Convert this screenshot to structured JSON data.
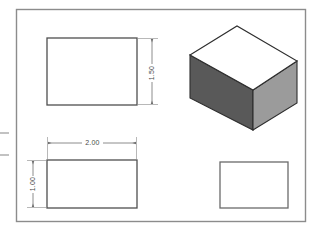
{
  "drawing": {
    "title": "Orthographic Multiview Drawing with Isometric Pictorial",
    "sheet": {
      "border_color": "#8c8c8c",
      "background_color": "#ffffff",
      "frame": {
        "x": 16,
        "y": 9,
        "width": 290,
        "height": 213
      }
    },
    "line_color": "#555555",
    "edge_color": "#3a3a3a",
    "dimension_color": "#6e6e6e",
    "views": [
      {
        "name": "front-view",
        "label": "Front View",
        "shape": "rectangle",
        "x": 47,
        "y": 38,
        "width": 90,
        "height": 67,
        "fill": "#ffffff"
      },
      {
        "name": "top-view",
        "label": "Top View",
        "shape": "rectangle",
        "x": 47,
        "y": 160,
        "width": 90,
        "height": 48,
        "fill": "#ffffff"
      },
      {
        "name": "right-side-view",
        "label": "Right Side View",
        "shape": "rectangle",
        "x": 220,
        "y": 162,
        "width": 68,
        "height": 46,
        "fill": "#ffffff"
      }
    ],
    "isometric": {
      "name": "isometric-box",
      "label": "Isometric Pictorial View",
      "faces": {
        "top": {
          "name": "top-face",
          "fill": "#ffffff",
          "points": "190,55 237,26 297,61 253,90"
        },
        "left": {
          "name": "left-face",
          "fill": "#595959",
          "points": "190,55 253,90 253,130 190,98"
        },
        "right": {
          "name": "right-face",
          "fill": "#9b9b9b",
          "points": "253,90 297,61 297,103 253,130"
        }
      }
    },
    "dimensions": [
      {
        "name": "dimension-height-1-50",
        "value": "1.50",
        "orientation": "vertical",
        "line_x": 152,
        "y1": 38,
        "y2": 105,
        "text_x": 152,
        "text_y": 73,
        "ext_from_x": 137,
        "ext_to_x": 157
      },
      {
        "name": "dimension-width-2-00",
        "value": "2.00",
        "orientation": "horizontal",
        "line_y": 143,
        "x1": 47,
        "x2": 137,
        "text_x": 92,
        "text_y": 145,
        "ext_from_y": 160,
        "ext_to_y": 138
      },
      {
        "name": "dimension-depth-1-00",
        "value": "1.00",
        "orientation": "vertical",
        "line_x": 33,
        "y1": 160,
        "y2": 208,
        "text_x": 33,
        "text_y": 184,
        "ext_from_x": 47,
        "ext_to_x": 28
      }
    ],
    "edge_marks": [
      {
        "name": "edge-tick-upper",
        "x1": 0,
        "y1": 133,
        "x2": 9,
        "y2": 133
      },
      {
        "name": "edge-tick-lower",
        "x1": 0,
        "y1": 155,
        "x2": 9,
        "y2": 155
      }
    ]
  }
}
